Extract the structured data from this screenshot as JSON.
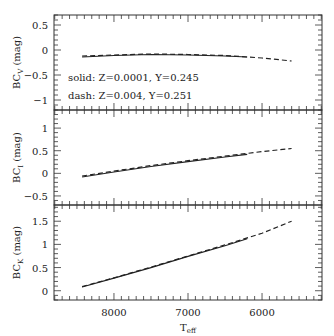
{
  "chart_data": {
    "type": "line",
    "layout": "3 vertically stacked panels sharing x-axis",
    "xlabel": "T_eff",
    "x_reversed": true,
    "xlim": [
      8810,
      5190
    ],
    "x_ticks": [
      8000,
      7000,
      6000
    ],
    "legend_annotations": [
      "solid: Z=0.0001, Y=0.245",
      "dash: Z=0.004, Y=0.251"
    ],
    "panels": [
      {
        "ylabel": "BC_V (mag)",
        "ylim": [
          -1.2,
          0.7
        ],
        "y_ticks": [
          0.5,
          0,
          -0.5,
          -1
        ],
        "y_tick_labels": [
          "0.5",
          "0",
          "−0.5",
          "−1"
        ],
        "series": [
          {
            "name": "solid: Z=0.0001, Y=0.245",
            "style": "solid",
            "x": [
              8430,
              8000,
              7500,
              7000,
              6500,
              6200
            ],
            "y": [
              -0.14,
              -0.11,
              -0.09,
              -0.1,
              -0.12,
              -0.14
            ]
          },
          {
            "name": "dash: Z=0.004, Y=0.251",
            "style": "dash",
            "x": [
              8430,
              8000,
              7500,
              7000,
              6500,
              6000,
              5600
            ],
            "y": [
              -0.12,
              -0.1,
              -0.08,
              -0.09,
              -0.11,
              -0.16,
              -0.22
            ]
          }
        ]
      },
      {
        "ylabel": "BC_I (mag)",
        "ylim": [
          -0.7,
          1.4
        ],
        "y_ticks": [
          1,
          0.5,
          0,
          -0.5
        ],
        "y_tick_labels": [
          "1",
          "0.5",
          "0",
          "−0.5"
        ],
        "series": [
          {
            "name": "solid: Z=0.0001, Y=0.245",
            "style": "solid",
            "x": [
              8430,
              8000,
              7500,
              7000,
              6500,
              6200
            ],
            "y": [
              -0.08,
              0.03,
              0.15,
              0.26,
              0.36,
              0.42
            ]
          },
          {
            "name": "dash: Z=0.004, Y=0.251",
            "style": "dash",
            "x": [
              8430,
              8000,
              7500,
              7000,
              6500,
              6000,
              5600
            ],
            "y": [
              -0.06,
              0.05,
              0.17,
              0.28,
              0.38,
              0.48,
              0.55
            ]
          }
        ]
      },
      {
        "ylabel": "BC_K (mag)",
        "ylim": [
          -0.2,
          1.85
        ],
        "y_ticks": [
          1.5,
          1,
          0.5,
          0
        ],
        "y_tick_labels": [
          "1.5",
          "1",
          "0.5",
          "0"
        ],
        "series": [
          {
            "name": "solid: Z=0.0001, Y=0.245",
            "style": "solid",
            "x": [
              8430,
              8000,
              7500,
              7000,
              6500,
              6200
            ],
            "y": [
              0.08,
              0.27,
              0.5,
              0.74,
              0.97,
              1.12
            ]
          },
          {
            "name": "dash: Z=0.004, Y=0.251",
            "style": "dash",
            "x": [
              8430,
              8000,
              7500,
              7000,
              6500,
              6000,
              5600
            ],
            "y": [
              0.09,
              0.28,
              0.51,
              0.75,
              0.99,
              1.24,
              1.5
            ]
          }
        ]
      }
    ]
  },
  "labels": {
    "xlabel_main": "T",
    "xlabel_sub": "eff",
    "ylabel_prefix": "BC",
    "ylabel_suffix": " (mag)",
    "panel_subs": [
      "V",
      "I",
      "K"
    ],
    "legend_solid": "solid: Z=0.0001, Y=0.245",
    "legend_dash": "dash: Z=0.004, Y=0.251"
  },
  "colors": {
    "line": "#222222",
    "axis": "#333333",
    "background": "#ffffff"
  }
}
